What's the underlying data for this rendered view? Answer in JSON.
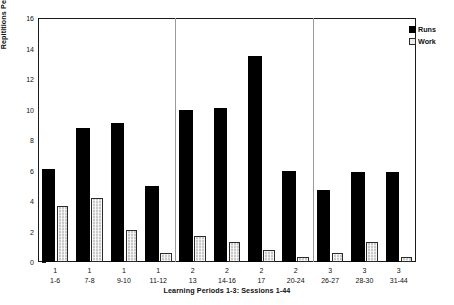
{
  "chart_data": {
    "type": "bar",
    "title": "",
    "xlabel": "Learning Periods 1-3: Sessions 1-44",
    "ylabel": "Repititions Per Bar",
    "ylim": [
      0,
      16
    ],
    "ytick_step": 2,
    "yticks": [
      "0",
      "2",
      "4",
      "6",
      "8",
      "10",
      "12",
      "14",
      "16"
    ],
    "grid": false,
    "legend_position": "top-right",
    "categories": [
      "1 1-6",
      "1 7-8",
      "1 9-10",
      "1 11-12",
      "2 13",
      "2 14-16",
      "2 17",
      "2 20-24",
      "3 26-27",
      "3 28-30",
      "3 31-44"
    ],
    "category_periods": [
      "1",
      "1",
      "1",
      "1",
      "2",
      "2",
      "2",
      "2",
      "3",
      "3",
      "3"
    ],
    "category_sessions": [
      "1-6",
      "7-8",
      "9-10",
      "11-12",
      "13",
      "14-16",
      "17",
      "20-24",
      "26-27",
      "28-30",
      "31-44"
    ],
    "series": [
      {
        "name": "Runs",
        "color": "#000000",
        "values": [
          6.1,
          8.8,
          9.1,
          5.0,
          10.0,
          10.1,
          13.5,
          6.0,
          4.7,
          5.9,
          5.9
        ]
      },
      {
        "name": "Work",
        "color": "#c9c9c9",
        "values": [
          3.7,
          4.2,
          2.1,
          0.6,
          1.7,
          1.3,
          0.8,
          0.3,
          0.6,
          1.3,
          0.3
        ]
      }
    ],
    "group_separators_after": [
      3,
      7
    ],
    "legend": [
      "Runs",
      "Work"
    ]
  }
}
